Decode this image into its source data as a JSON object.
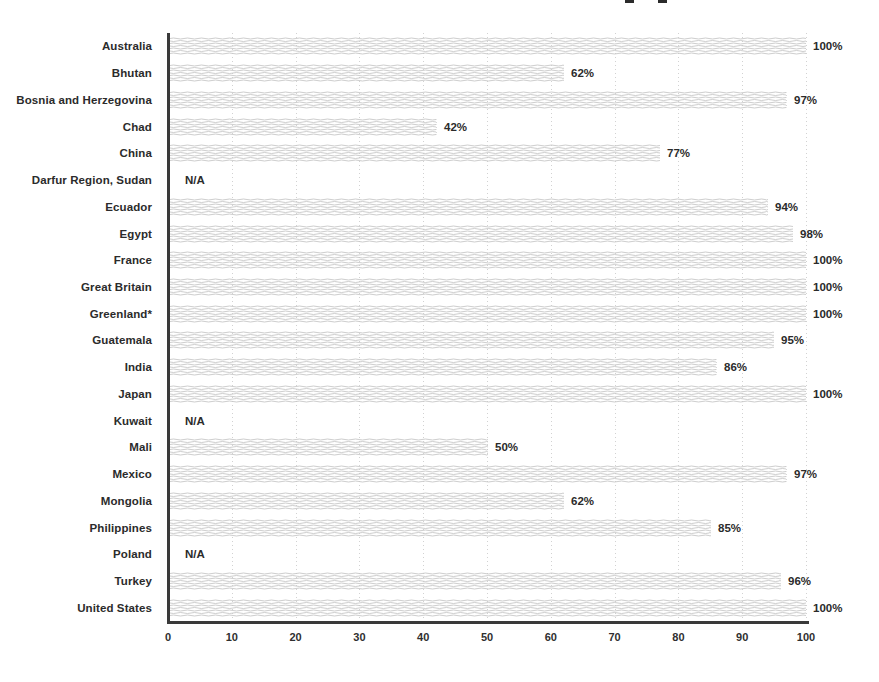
{
  "chart_data": {
    "type": "bar",
    "orientation": "horizontal",
    "title": "",
    "xlabel": "",
    "ylabel": "",
    "categories": [
      "Australia",
      "Bhutan",
      "Bosnia and Herzegovina",
      "Chad",
      "China",
      "Darfur Region, Sudan",
      "Ecuador",
      "Egypt",
      "France",
      "Great Britain",
      "Greenland*",
      "Guatemala",
      "India",
      "Japan",
      "Kuwait",
      "Mali",
      "Mexico",
      "Mongolia",
      "Philippines",
      "Poland",
      "Turkey",
      "United States"
    ],
    "values": [
      100,
      62,
      97,
      42,
      77,
      null,
      94,
      98,
      100,
      100,
      100,
      95,
      86,
      100,
      null,
      50,
      97,
      62,
      85,
      null,
      96,
      100
    ],
    "value_labels": [
      "100%",
      "62%",
      "97%",
      "42%",
      "77%",
      "N/A",
      "94%",
      "98%",
      "100%",
      "100%",
      "100%",
      "95%",
      "86%",
      "100%",
      "N/A",
      "50%",
      "97%",
      "62%",
      "85%",
      "N/A",
      "96%",
      "100%"
    ],
    "na_label": "N/A",
    "x_ticks": [
      "0",
      "10",
      "20",
      "30",
      "40",
      "50",
      "60",
      "70",
      "80",
      "90",
      "100"
    ],
    "xlim": [
      0,
      100
    ],
    "grid": "vertical-dotted",
    "legend": "none",
    "bar_texture": "wavy-horizontal-lines",
    "colors": {
      "background": "#ffffff",
      "bar_line": "#c7c7c7",
      "axis": "#3a3a3a",
      "text": "#2b2b2b",
      "gridline": "#d2d2d2"
    }
  },
  "decor": {
    "cropped_title_marks": 2
  }
}
